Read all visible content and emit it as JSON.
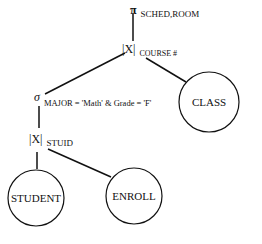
{
  "diagram": {
    "type": "relational-algebra-query-tree",
    "nodes": {
      "projection": {
        "symbol": "π",
        "subscript": "SCHED,ROOM"
      },
      "join_course": {
        "symbol": "|X|",
        "subscript": "COURSE #"
      },
      "selection": {
        "symbol": "σ",
        "subscript": "MAJOR = 'Math' & Grade = 'F'"
      },
      "join_stuid": {
        "symbol": "|X|",
        "subscript": "STUID"
      },
      "class": {
        "label": "CLASS"
      },
      "student": {
        "label": "STUDENT"
      },
      "enroll": {
        "label": "ENROLL"
      }
    },
    "edges": [
      [
        "projection",
        "join_course"
      ],
      [
        "join_course",
        "selection"
      ],
      [
        "join_course",
        "class"
      ],
      [
        "selection",
        "join_stuid"
      ],
      [
        "join_stuid",
        "student"
      ],
      [
        "join_stuid",
        "enroll"
      ]
    ],
    "colors": {
      "line": "#111111",
      "background": "#ffffff"
    }
  }
}
